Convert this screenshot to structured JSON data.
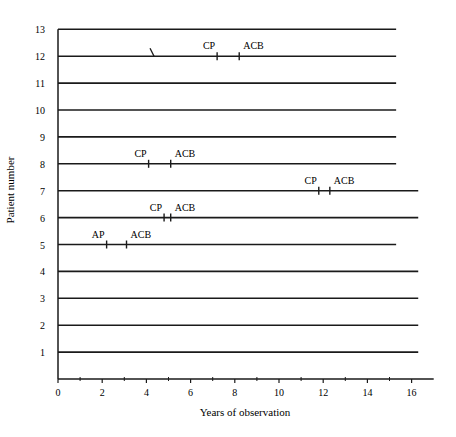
{
  "chart_data": {
    "type": "timeline",
    "title": "",
    "xlabel": "Years of observation",
    "ylabel": "Patient number",
    "xlim": [
      0,
      17
    ],
    "ylim": [
      0,
      13
    ],
    "x_ticks_labeled": [
      0,
      2,
      4,
      6,
      8,
      10,
      12,
      14,
      16
    ],
    "x_ticks_minor": [
      1,
      3,
      5,
      7,
      9,
      11,
      13,
      15
    ],
    "y_ticks": [
      1,
      2,
      3,
      4,
      5,
      6,
      7,
      8,
      9,
      10,
      11,
      12,
      13
    ],
    "grid": false,
    "legend": null,
    "patients": [
      {
        "patient": 13,
        "start": 0,
        "end": 15.3,
        "events": []
      },
      {
        "patient": 12,
        "start": 0,
        "end": 15.3,
        "events": [
          {
            "label": "",
            "type": "break",
            "x": 4.3
          },
          {
            "label": "CP",
            "x": 7.2
          },
          {
            "label": "ACB",
            "x": 8.2
          }
        ]
      },
      {
        "patient": 11,
        "start": 0,
        "end": 15.3,
        "events": []
      },
      {
        "patient": 10,
        "start": 0,
        "end": 15.3,
        "events": []
      },
      {
        "patient": 9,
        "start": 0,
        "end": 15.3,
        "events": []
      },
      {
        "patient": 8,
        "start": 0,
        "end": 15.3,
        "events": [
          {
            "label": "CP",
            "x": 4.1
          },
          {
            "label": "ACB",
            "x": 5.1
          }
        ]
      },
      {
        "patient": 7,
        "start": 0,
        "end": 16.3,
        "events": [
          {
            "label": "CP",
            "x": 11.8
          },
          {
            "label": "ACB",
            "x": 12.3
          }
        ]
      },
      {
        "patient": 6,
        "start": 0,
        "end": 16.3,
        "events": [
          {
            "label": "CP",
            "x": 4.8
          },
          {
            "label": "ACB",
            "x": 5.1
          }
        ]
      },
      {
        "patient": 5,
        "start": 0,
        "end": 15.3,
        "events": [
          {
            "label": "AP",
            "x": 2.2
          },
          {
            "label": "ACB",
            "x": 3.1
          }
        ]
      },
      {
        "patient": 4,
        "start": 0,
        "end": 16.3,
        "events": []
      },
      {
        "patient": 3,
        "start": 0,
        "end": 16.3,
        "events": []
      },
      {
        "patient": 2,
        "start": 0,
        "end": 16.3,
        "events": []
      },
      {
        "patient": 1,
        "start": 0,
        "end": 16.3,
        "events": []
      }
    ]
  }
}
